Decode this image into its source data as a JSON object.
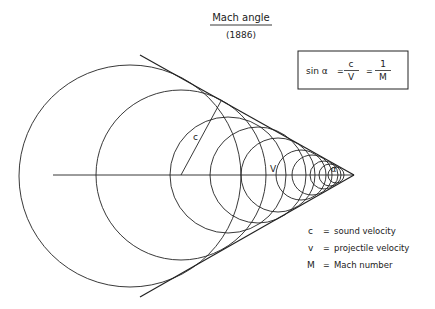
{
  "title": {
    "main": "Mach angle",
    "year": "(1886)"
  },
  "formula": {
    "lhs": "sin α",
    "eq1": "=",
    "frac1_num": "c",
    "frac1_den": "V",
    "eq2": "=",
    "frac2_num": "1",
    "frac2_den": "M"
  },
  "diagram_labels": {
    "c": "c",
    "v": "V",
    "alpha": "α"
  },
  "legend": [
    {
      "symbol": "c",
      "eq": "=",
      "text": "sound velocity"
    },
    {
      "symbol": "v",
      "eq": "=",
      "text": "projectile velocity"
    },
    {
      "symbol": "M",
      "eq": "=",
      "text": "Mach number"
    }
  ],
  "colors": {
    "ink": "#222222",
    "background": "#ffffff"
  }
}
